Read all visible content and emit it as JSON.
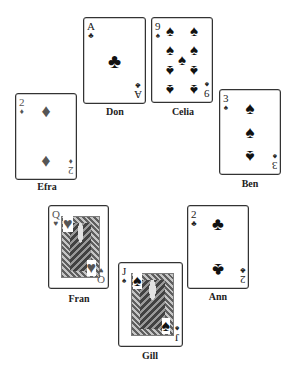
{
  "table": {
    "background": "#ffffff",
    "players": [
      {
        "name": "Don",
        "card": {
          "rank": "A",
          "suit": "clubs",
          "suit_glyph": "♣",
          "color": "#111111"
        }
      },
      {
        "name": "Celia",
        "card": {
          "rank": "9",
          "suit": "spades",
          "suit_glyph": "♠",
          "color": "#111111"
        }
      },
      {
        "name": "Efra",
        "card": {
          "rank": "2",
          "suit": "diamonds",
          "suit_glyph": "♦",
          "color": "#555555"
        }
      },
      {
        "name": "Ben",
        "card": {
          "rank": "3",
          "suit": "spades",
          "suit_glyph": "♠",
          "color": "#111111"
        }
      },
      {
        "name": "Fran",
        "card": {
          "rank": "Q",
          "suit": "hearts",
          "suit_glyph": "♥",
          "color": "#555555"
        }
      },
      {
        "name": "Ann",
        "card": {
          "rank": "2",
          "suit": "clubs",
          "suit_glyph": "♣",
          "color": "#111111"
        }
      },
      {
        "name": "Gill",
        "card": {
          "rank": "J",
          "suit": "spades",
          "suit_glyph": "♠",
          "color": "#111111"
        }
      }
    ]
  }
}
